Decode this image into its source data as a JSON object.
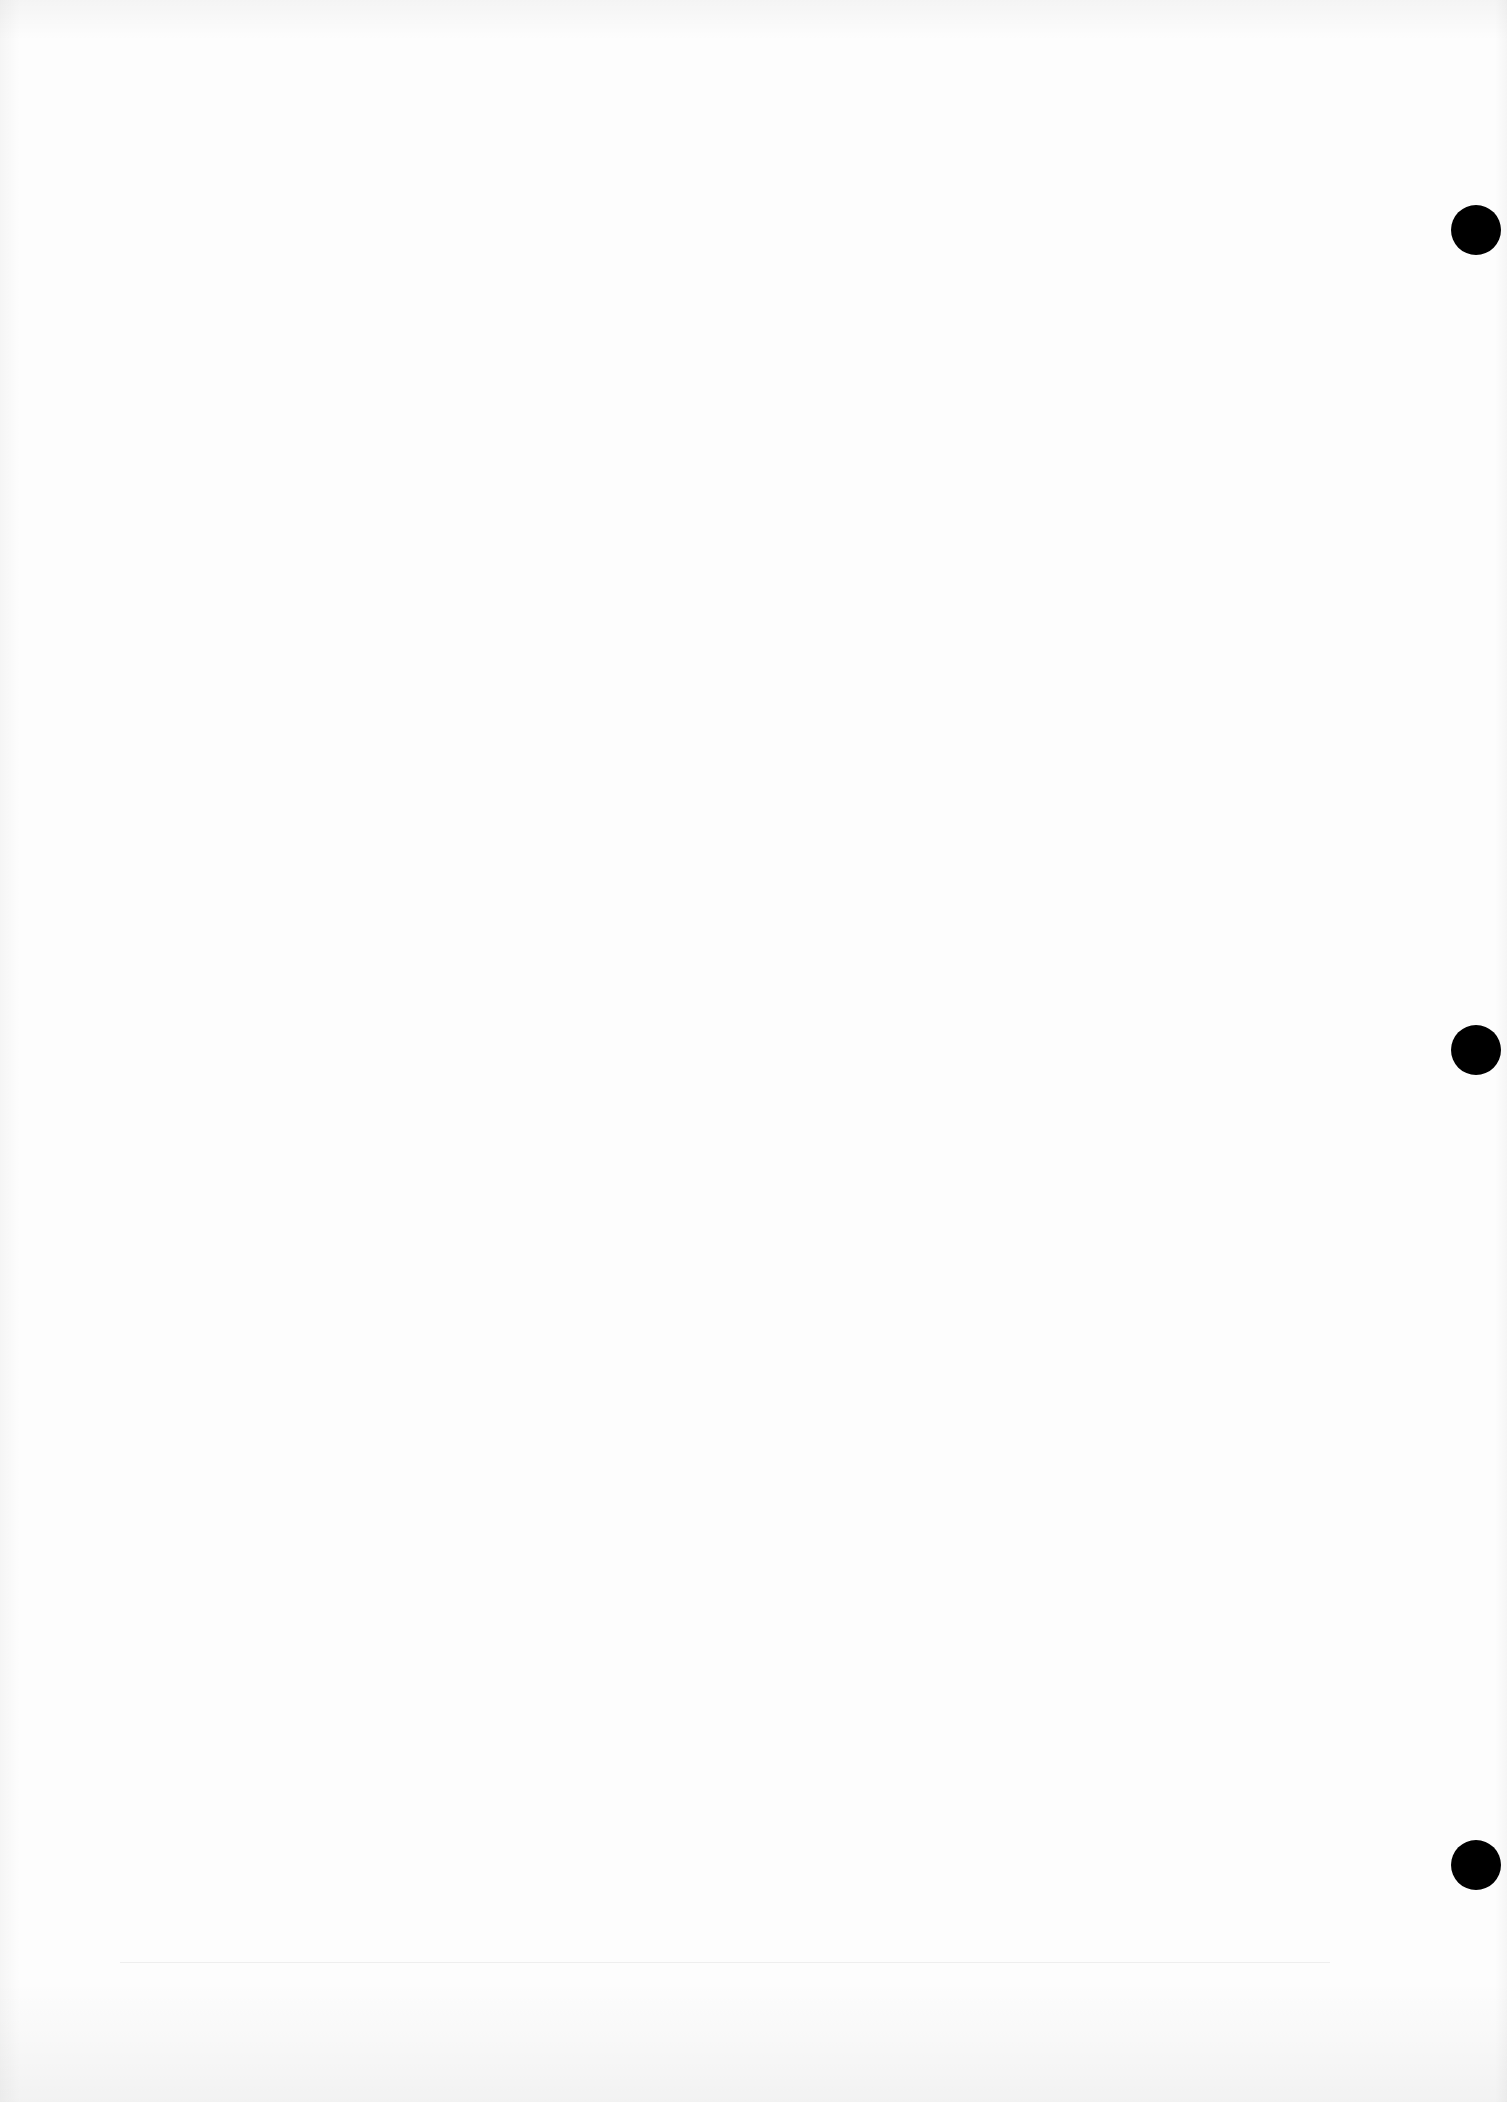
{
  "document": {
    "type": "blank-scanned-page",
    "text": "",
    "punch_holes": [
      {
        "cx": 1476,
        "cy": 230
      },
      {
        "cx": 1476,
        "cy": 1050
      },
      {
        "cx": 1476,
        "cy": 1865
      }
    ],
    "colors": {
      "paper": "#fdfdfd",
      "hole": "#000000"
    }
  }
}
